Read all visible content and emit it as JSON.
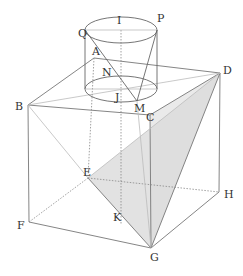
{
  "figure": {
    "colors": {
      "edge": "#777777",
      "shade": "#e4e4e4",
      "label": "#333333"
    },
    "labels": {
      "I": "I",
      "P": "P",
      "Q": "Q",
      "A": "A",
      "N": "N",
      "J": "J",
      "M": "M",
      "C": "C",
      "D": "D",
      "B": "B",
      "E": "E",
      "F": "F",
      "K": "K",
      "G": "G",
      "H": "H"
    }
  }
}
